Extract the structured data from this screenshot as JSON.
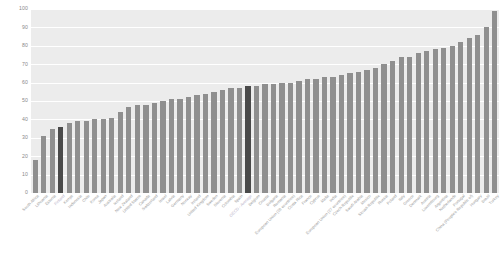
{
  "chart_data": {
    "type": "bar",
    "title": "",
    "subtitle": "",
    "xlabel": "",
    "ylabel": "",
    "ylim": [
      0,
      100
    ],
    "yticks": [
      0,
      10,
      20,
      30,
      40,
      50,
      60,
      70,
      80,
      90,
      100
    ],
    "grid": true,
    "legend": "none",
    "orientation": "vertical",
    "sorted": "ascending",
    "bar_color": "#8f8f8f",
    "highlight_color": "#4a4a4a",
    "plot_background": "#ececec",
    "gridline_color": "#ffffff",
    "label_color": "#9a9a9a",
    "highlight_label_color": "#b9b2c9",
    "categories": [
      "South Africa",
      "Lithuania",
      "Estonia",
      "Finland",
      "Kenya",
      "Indonesia",
      "Chile",
      "Korea",
      "Japan",
      "Australia",
      "Iceland",
      "New Zealand",
      "United States",
      "Canada",
      "Switzerland",
      "Israel",
      "Latvia",
      "Germany",
      "Norway",
      "Ireland",
      "United Kingdom",
      "Sweden",
      "Slovenia",
      "Colombia",
      "Spain",
      "OECD - Average",
      "Belgium",
      "Croatia",
      "Bulgaria",
      "Romania",
      "European Union (28 countries)",
      "Costa Rica",
      "France",
      "Cyprus",
      "Malta",
      "India",
      "European Union (27 countries)",
      "Czech Republic",
      "Saudi Arabia",
      "Mexico",
      "Slovak Republic",
      "Russia",
      "Poland",
      "Italy",
      "Greece",
      "Denmark",
      "Austria",
      "Luxembourg",
      "Argentina",
      "Netherlands",
      "Portugal",
      "China (People's Republic of)",
      "Hungary",
      "Brazil",
      "Turkey"
    ],
    "values": [
      18,
      31,
      35,
      36,
      38,
      39,
      39,
      40,
      40,
      41,
      44,
      47,
      48,
      48,
      49,
      50,
      51,
      51,
      52,
      53,
      54,
      55,
      56,
      57,
      57,
      58,
      58,
      59,
      59,
      60,
      60,
      61,
      62,
      62,
      63,
      63,
      64,
      65,
      66,
      67,
      68,
      70,
      72,
      74,
      74,
      76,
      77,
      78,
      79,
      80,
      82,
      84,
      86,
      90,
      99
    ],
    "highlighted": [
      "Finland",
      "OECD - Average"
    ]
  }
}
